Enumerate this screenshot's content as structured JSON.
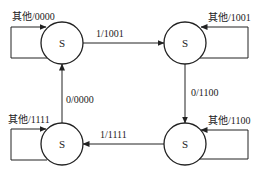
{
  "diagram": {
    "type": "state-machine",
    "states": [
      {
        "id": "tl",
        "label": "S",
        "cx": 62,
        "cy": 43
      },
      {
        "id": "tr",
        "label": "S",
        "cx": 185,
        "cy": 43
      },
      {
        "id": "br",
        "label": "S",
        "cx": 185,
        "cy": 144
      },
      {
        "id": "bl",
        "label": "S",
        "cx": 62,
        "cy": 144
      }
    ],
    "transitions": [
      {
        "from": "tl",
        "to": "tr",
        "label": "1/1001"
      },
      {
        "from": "tr",
        "to": "br",
        "label": "0/1100"
      },
      {
        "from": "br",
        "to": "bl",
        "label": "1/1111"
      },
      {
        "from": "bl",
        "to": "tl",
        "label": "0/0000"
      }
    ],
    "self_loops": [
      {
        "state": "tl",
        "label": "其他/0000"
      },
      {
        "state": "tr",
        "label": "其他/1001"
      },
      {
        "state": "br",
        "label": "其他/1100"
      },
      {
        "state": "bl",
        "label": "其他/1111"
      }
    ]
  }
}
